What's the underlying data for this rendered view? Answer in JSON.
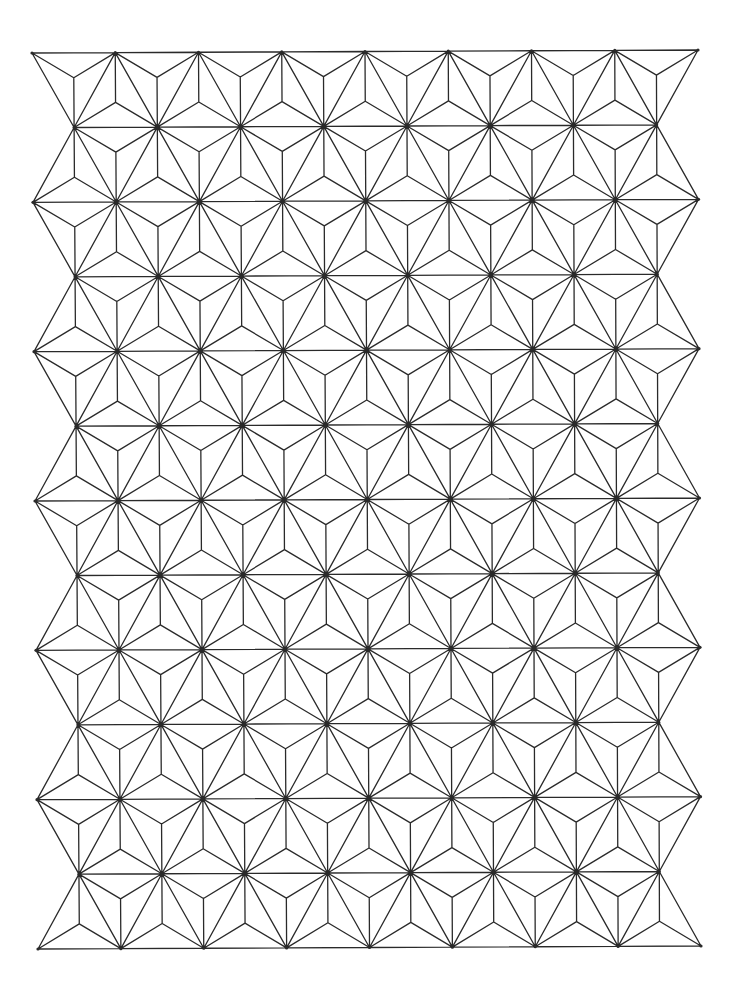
{
  "title": "Asanoha (hemp leaf) geometric line pattern",
  "canvas": {
    "width": 750,
    "height": 998,
    "background": "#ffffff"
  },
  "pattern": {
    "type": "asanoha",
    "stroke_color": "#2a2a2a",
    "stroke_width": 1.3,
    "vertex_dot_radius": 1.6,
    "rows": 13,
    "even_row_vertex_count": 9,
    "odd_row_vertex_count": 8,
    "corners": {
      "top_left": [
        32,
        53
      ],
      "top_right": [
        698,
        50
      ],
      "bottom_left": [
        38,
        949
      ],
      "bottom_right": [
        701,
        946
      ]
    }
  }
}
